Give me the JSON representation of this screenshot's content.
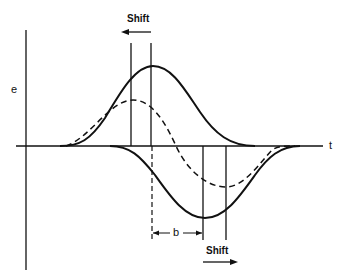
{
  "diagram": {
    "axes": {
      "y_label": "e",
      "x_label": "t"
    },
    "annotations": {
      "shift_top": "Shift",
      "shift_bottom": "Shift",
      "offset_label": "b"
    },
    "curves": [
      {
        "name": "upper-solid-pulse",
        "style": "solid",
        "polarity": "positive"
      },
      {
        "name": "dashed-difference",
        "style": "dashed",
        "polarity": "bipolar"
      },
      {
        "name": "lower-solid-pulse",
        "style": "solid",
        "polarity": "negative"
      }
    ],
    "colors": {
      "ink": "#111111",
      "background": "#ffffff"
    }
  }
}
